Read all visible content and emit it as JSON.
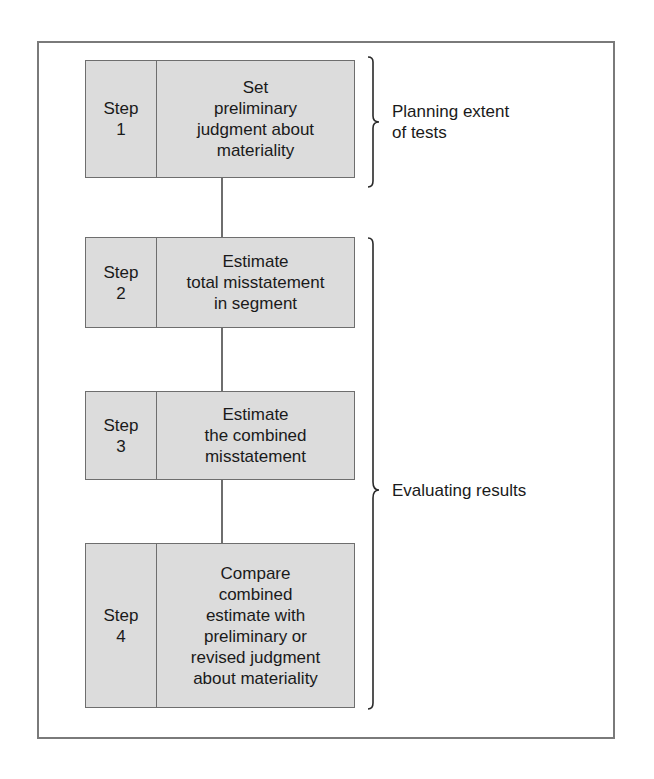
{
  "steps": [
    {
      "step_label": "Step",
      "step_number": "1",
      "lines": [
        "Set",
        "preliminary",
        "judgment about",
        "materiality"
      ]
    },
    {
      "step_label": "Step",
      "step_number": "2",
      "lines": [
        "Estimate",
        "total misstatement",
        "in segment"
      ]
    },
    {
      "step_label": "Step",
      "step_number": "3",
      "lines": [
        "Estimate",
        "the combined",
        "misstatement"
      ]
    },
    {
      "step_label": "Step",
      "step_number": "4",
      "lines": [
        "Compare",
        "combined",
        "estimate with",
        "preliminary or",
        "revised judgment",
        "about materiality"
      ]
    }
  ],
  "brackets": [
    {
      "lines": [
        "Planning extent",
        "of tests"
      ],
      "covers_steps": [
        1
      ]
    },
    {
      "lines": [
        "Evaluating results"
      ],
      "covers_steps": [
        2,
        3,
        4
      ]
    }
  ],
  "colors": {
    "box_fill": "#dcdcdc",
    "border": "#6e6e6e",
    "frame": "#7a7a7a"
  }
}
